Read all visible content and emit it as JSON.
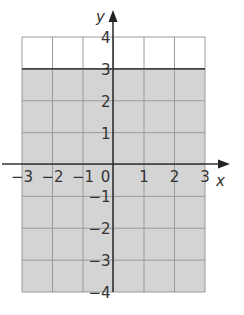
{
  "chart_data": {
    "type": "region",
    "title": "",
    "xlabel": "x",
    "ylabel": "y",
    "xlim": [
      -3,
      3
    ],
    "ylim": [
      -4,
      4
    ],
    "x_ticks": [
      "−3",
      "−2",
      "−1",
      "0",
      "1",
      "2",
      "3"
    ],
    "y_ticks": [
      "4",
      "3",
      "2",
      "1",
      "−1",
      "−2",
      "−3",
      "−4"
    ],
    "grid": true,
    "boundary_line": {
      "equation": "y = 3",
      "style": "solid"
    },
    "shaded_region": "y < 3",
    "colors": {
      "shade": "#d4d4d4",
      "grid": "#9a9a9a",
      "axis": "#333333",
      "boundary": "#444444"
    }
  },
  "labels": {
    "x_axis": "x",
    "y_axis": "y",
    "x_ticks": [
      {
        "v": -3,
        "t": "−3"
      },
      {
        "v": -2,
        "t": "−2"
      },
      {
        "v": -1,
        "t": "−1"
      },
      {
        "v": 0,
        "t": "0"
      },
      {
        "v": 1,
        "t": "1"
      },
      {
        "v": 2,
        "t": "2"
      },
      {
        "v": 3,
        "t": "3"
      }
    ],
    "y_ticks": [
      {
        "v": 4,
        "t": "4"
      },
      {
        "v": 3,
        "t": "3"
      },
      {
        "v": 2,
        "t": "2"
      },
      {
        "v": 1,
        "t": "1"
      },
      {
        "v": -1,
        "t": "−1"
      },
      {
        "v": -2,
        "t": "−2"
      },
      {
        "v": -3,
        "t": "−3"
      },
      {
        "v": -4,
        "t": "−4"
      }
    ]
  }
}
